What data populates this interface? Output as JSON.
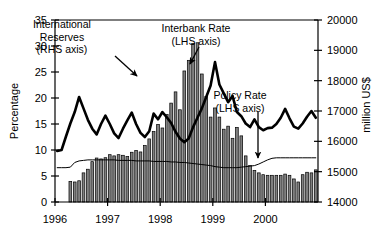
{
  "chart_data": {
    "type": "bar",
    "title": "",
    "subtitle": "",
    "xlabel": "",
    "ylabel": "Percentage",
    "y2label": "million US$",
    "ylim": [
      0,
      35
    ],
    "y2lim": [
      14000,
      20000
    ],
    "yticks": [
      0,
      5,
      10,
      15,
      20,
      25,
      30,
      35
    ],
    "ytick_labels": [
      "0",
      "5",
      "10",
      "15",
      "20",
      "25",
      "30",
      "35"
    ],
    "y2ticks": [
      14000,
      15000,
      16000,
      17000,
      18000,
      19000,
      20000
    ],
    "y2tick_labels": [
      "14000",
      "15000",
      "16000",
      "17000",
      "18000",
      "19000",
      "20000"
    ],
    "xticks": [
      0,
      12,
      24,
      36,
      48
    ],
    "xtick_labels": [
      "1996",
      "1997",
      "1998",
      "1999",
      "2000"
    ],
    "xlim": [
      0,
      60
    ],
    "grid": false,
    "legend": "annotations",
    "n_points": 60,
    "series": [
      {
        "name": "International Reserves",
        "axis": "right",
        "unit": "million US$",
        "render": "bar",
        "color": "#808080",
        "edge_color": "#000000",
        "values": [
          14000,
          14000,
          14000,
          14680,
          14660,
          14700,
          14960,
          15080,
          15330,
          15450,
          15420,
          15460,
          15560,
          15520,
          15560,
          15540,
          15500,
          15640,
          15700,
          15650,
          15860,
          16080,
          16320,
          16560,
          16440,
          16880,
          17260,
          17630,
          17040,
          18320,
          18670,
          19230,
          19250,
          18220,
          17480,
          16800,
          17100,
          16800,
          16400,
          16500,
          16100,
          16460,
          16180,
          15520,
          15200,
          15040,
          14960,
          14900,
          14880,
          14880,
          14880,
          14880,
          14920,
          14880,
          14760,
          14660,
          14900,
          14980,
          14960,
          15060
        ]
      },
      {
        "name": "Interbank Rate",
        "axis": "left",
        "unit": "Percentage",
        "render": "line",
        "color": "#000000",
        "line_width": 2.6,
        "values": [
          9.8,
          10.0,
          12.6,
          15.1,
          17.3,
          20.2,
          18.0,
          15.8,
          14.1,
          13.0,
          15.0,
          16.6,
          15.0,
          13.2,
          12.3,
          14.1,
          15.7,
          17.2,
          15.0,
          13.3,
          12.5,
          13.6,
          17.0,
          15.9,
          17.3,
          16.3,
          15.2,
          13.5,
          12.2,
          11.5,
          12.2,
          14.4,
          16.2,
          18.0,
          20.2,
          22.4,
          26.9,
          22.6,
          20.9,
          19.2,
          20.4,
          17.3,
          16.5,
          15.1,
          14.4,
          15.9,
          14.4,
          13.8,
          14.2,
          14.3,
          15.0,
          16.2,
          17.9,
          16.1,
          14.5,
          14.1,
          15.1,
          16.4,
          17.5,
          16.2
        ]
      },
      {
        "name": "Policy Rate",
        "axis": "left",
        "unit": "Percentage",
        "render": "line",
        "color": "#000000",
        "line_width": 1.0,
        "values": [
          6.6,
          6.6,
          6.6,
          6.7,
          7.6,
          7.9,
          8.0,
          8.1,
          8.1,
          8.1,
          8.1,
          8.1,
          8.1,
          8.1,
          8.0,
          8.0,
          8.0,
          8.0,
          7.9,
          7.9,
          7.9,
          7.9,
          7.8,
          7.8,
          7.8,
          7.8,
          7.7,
          7.7,
          7.6,
          7.6,
          7.5,
          7.4,
          7.3,
          7.2,
          7.1,
          7.0,
          6.8,
          6.7,
          6.6,
          6.6,
          6.6,
          6.6,
          6.7,
          6.8,
          6.9,
          7.0,
          7.3,
          7.7,
          8.1,
          8.4,
          8.5,
          8.5,
          8.5,
          8.5,
          8.5,
          8.5,
          8.5,
          8.5,
          8.5,
          8.5
        ]
      }
    ],
    "annotations": [
      {
        "id": "international-reserves",
        "line1": "International",
        "line2": "Reserves",
        "line3": "(RHS axis)",
        "text_x": 62,
        "text_y": 28,
        "arrow_from_x": 115,
        "arrow_from_y": 56,
        "arrow_to_x": 137,
        "arrow_to_y": 76
      },
      {
        "id": "interbank-rate",
        "line1": "Interbank Rate",
        "line2": "(LHS axis)",
        "line3": "",
        "text_x": 196,
        "text_y": 32,
        "arrow_from_x": 199,
        "arrow_from_y": 47,
        "arrow_to_x": 190,
        "arrow_to_y": 64
      },
      {
        "id": "policy-rate",
        "line1": "Policy Rate",
        "line2": "(LHS axis)",
        "line3": "",
        "text_x": 240,
        "text_y": 99,
        "arrow_from_x": 258,
        "arrow_from_y": 112,
        "arrow_to_x": 258,
        "arrow_to_y": 158
      }
    ]
  }
}
